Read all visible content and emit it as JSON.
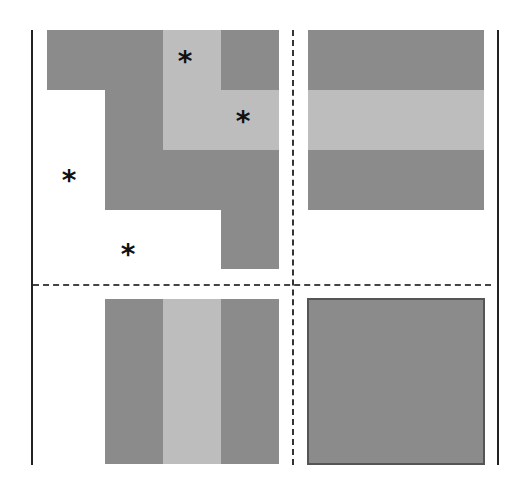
{
  "diagram": {
    "colors": {
      "dark": "#8b8b8b",
      "light": "#bdbdbd",
      "line": "#222222",
      "background": "#ffffff"
    },
    "markers": [
      "*",
      "*",
      "*",
      "*"
    ],
    "quadrants": [
      {
        "id": "top-left",
        "content": "L-shaped dark region with light inner L region, two asterisks in light region, two asterisks in white region"
      },
      {
        "id": "top-right",
        "content": "Dark block with horizontal light band in middle"
      },
      {
        "id": "bottom-left",
        "content": "Dark block with vertical light band in middle"
      },
      {
        "id": "bottom-right",
        "content": "Solid dark block with border"
      }
    ]
  }
}
